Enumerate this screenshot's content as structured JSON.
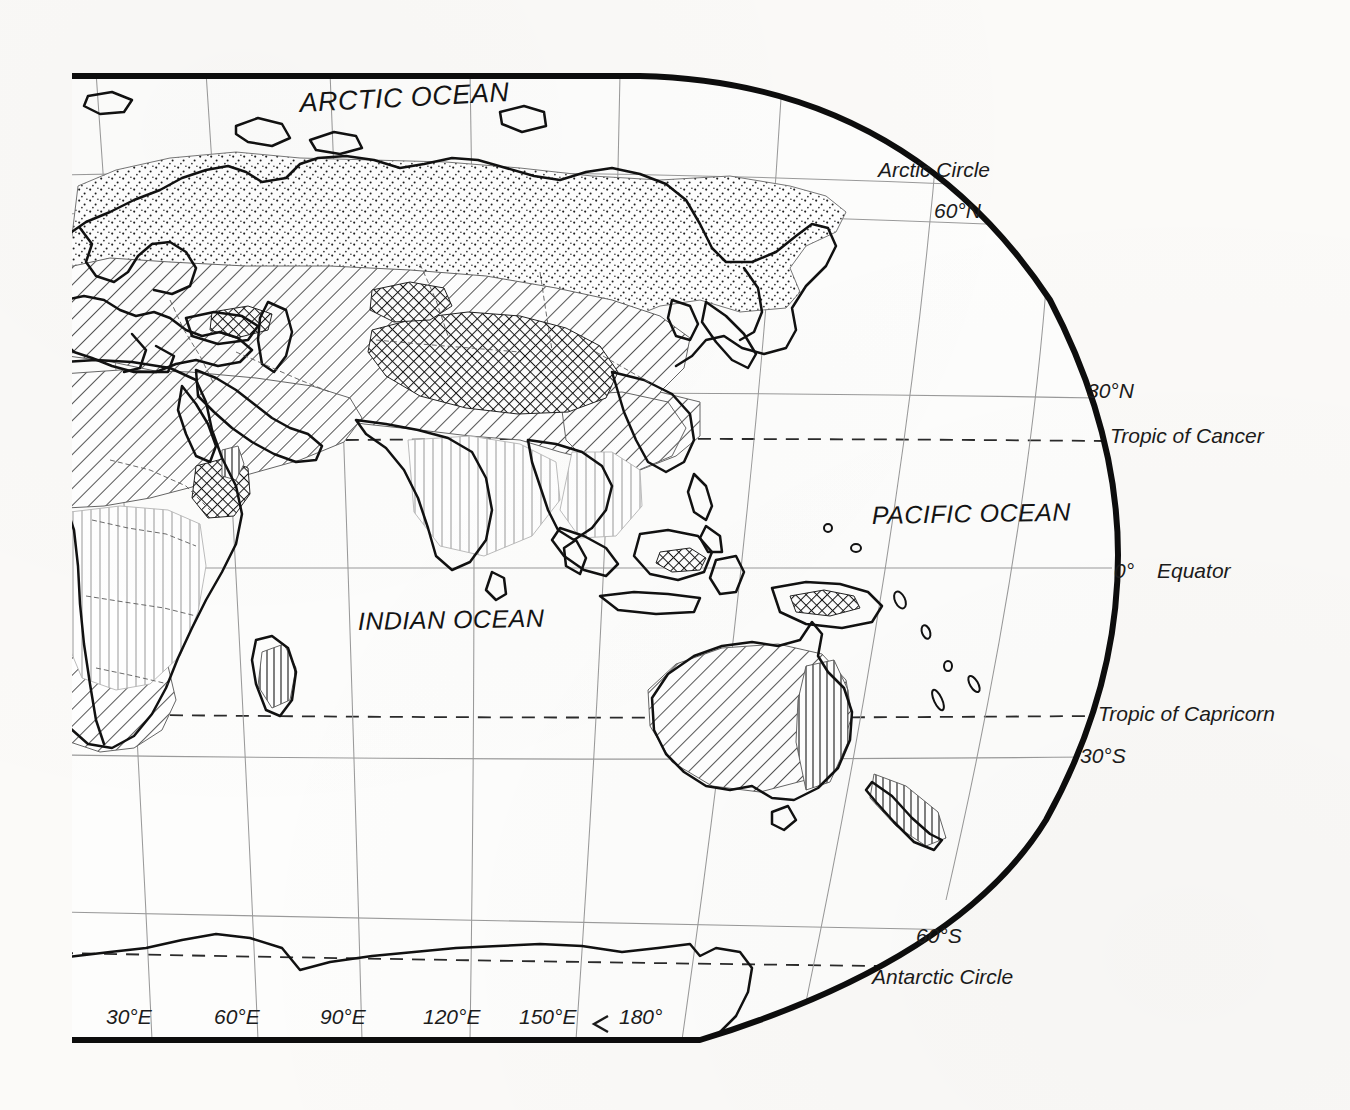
{
  "map": {
    "projection_label": "hemispheric-eastern-world-map",
    "background_color": "#fbfaf8",
    "ink_color": "#1b1b1b",
    "border_color": "#111111",
    "graticule_color": "#8a8a8a",
    "title": "",
    "ocean_labels": [
      {
        "name": "arctic-ocean",
        "text": "ARCTIC OCEAN",
        "x": 300,
        "y": 112,
        "size": 27,
        "rotate": -3
      },
      {
        "name": "pacific-ocean",
        "text": "PACIFIC OCEAN",
        "x": 872,
        "y": 524,
        "size": 25,
        "rotate": -1
      },
      {
        "name": "indian-ocean",
        "text": "INDIAN OCEAN",
        "x": 358,
        "y": 630,
        "size": 25,
        "rotate": -1
      }
    ],
    "latitude_labels": [
      {
        "name": "arctic-circle",
        "text": "Arctic Circle",
        "x": 878,
        "y": 177,
        "size": 21,
        "kind": "named-circle"
      },
      {
        "name": "lat-60n",
        "text": "60°N",
        "x": 934,
        "y": 218,
        "size": 21,
        "kind": "parallel"
      },
      {
        "name": "lat-30n",
        "text": "30°N",
        "x": 1087,
        "y": 398,
        "size": 21,
        "kind": "parallel"
      },
      {
        "name": "tropic-of-cancer",
        "text": "Tropic of Cancer",
        "x": 1110,
        "y": 443,
        "size": 21,
        "kind": "named-circle"
      },
      {
        "name": "equator-degree",
        "text": "0°",
        "x": 1114,
        "y": 578,
        "size": 21,
        "kind": "parallel"
      },
      {
        "name": "equator",
        "text": "Equator",
        "x": 1157,
        "y": 578,
        "size": 21,
        "kind": "named-circle"
      },
      {
        "name": "tropic-of-capricorn",
        "text": "Tropic of Capricorn",
        "x": 1098,
        "y": 721,
        "size": 21,
        "kind": "named-circle"
      },
      {
        "name": "lat-30s",
        "text": "30°S",
        "x": 1080,
        "y": 763,
        "size": 21,
        "kind": "parallel"
      },
      {
        "name": "lat-60s",
        "text": "60°S",
        "x": 916,
        "y": 943,
        "size": 21,
        "kind": "parallel"
      },
      {
        "name": "antarctic-circle",
        "text": "Antarctic Circle",
        "x": 872,
        "y": 984,
        "size": 21,
        "kind": "named-circle"
      }
    ],
    "longitude_labels": [
      {
        "name": "lon-30e",
        "text": "30°E",
        "x": 106,
        "y": 1024,
        "size": 21
      },
      {
        "name": "lon-60e",
        "text": "60°E",
        "x": 214,
        "y": 1024,
        "size": 21
      },
      {
        "name": "lon-90e",
        "text": "90°E",
        "x": 320,
        "y": 1024,
        "size": 21
      },
      {
        "name": "lon-120e",
        "text": "120°E",
        "x": 423,
        "y": 1024,
        "size": 21
      },
      {
        "name": "lon-150e",
        "text": "150°E",
        "x": 519,
        "y": 1024,
        "size": 21
      },
      {
        "name": "lon-180",
        "text": "180°",
        "x": 619,
        "y": 1024,
        "size": 21
      }
    ],
    "patterns": [
      {
        "name": "stipple-pattern",
        "description": "dotted stipple",
        "region": "northern-eurasia-siberia"
      },
      {
        "name": "diagonal-hatch-pattern",
        "description": "single diagonal hatching",
        "region": "arid-and-midlatitude-belt"
      },
      {
        "name": "cross-hatch-pattern",
        "description": "dense cross hatching",
        "region": "central-asian-highlands-tibet"
      },
      {
        "name": "vertical-hatch-pattern",
        "description": "fine vertical lines",
        "region": "equatorial-africa-india-se-asia"
      }
    ]
  }
}
